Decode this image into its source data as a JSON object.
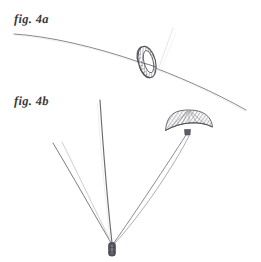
{
  "plate": {
    "width": 261,
    "height": 262,
    "background_color": "#ffffff",
    "ink_color": "#4a4a4e",
    "medium": "engraved line drawing on aged paper"
  },
  "figures": [
    {
      "id": "fig-4a",
      "label": "fig. 4a",
      "caption_position": "top-left",
      "subject": "ring threaded on a descending trajectory arc",
      "elements": [
        {
          "name": "trajectory-arc",
          "kind": "curve",
          "shading": "strong"
        },
        {
          "name": "ring-body",
          "kind": "annulus-perspective",
          "shading": "cross-hatched"
        },
        {
          "name": "ring-axis-line",
          "kind": "line",
          "shading": "ghost"
        }
      ]
    },
    {
      "id": "fig-4b",
      "label": "fig. 4b",
      "caption_position": "mid-left",
      "subject": "canopy with suspension lines converging on a suspended weight",
      "elements": [
        {
          "name": "canopy-dome",
          "kind": "dome",
          "shading": "cross-hatched"
        },
        {
          "name": "suspension-line-left-outer",
          "kind": "line",
          "shading": "strong"
        },
        {
          "name": "suspension-line-left-inner",
          "kind": "line",
          "shading": "faint"
        },
        {
          "name": "suspension-line-vertical",
          "kind": "line",
          "shading": "strong"
        },
        {
          "name": "suspension-line-right-outer",
          "kind": "line",
          "shading": "mid"
        },
        {
          "name": "suspension-line-right-inner",
          "kind": "line",
          "shading": "mid"
        },
        {
          "name": "suspended-weight",
          "kind": "capsule",
          "shading": "solid"
        }
      ]
    }
  ],
  "colors": {
    "paper": "#ffffff",
    "ink_strong": "#4a4a4e",
    "ink_mid": "#6e6e74",
    "ink_faint": "#b6b6bc",
    "ink_ghost": "#d8d8dd"
  }
}
